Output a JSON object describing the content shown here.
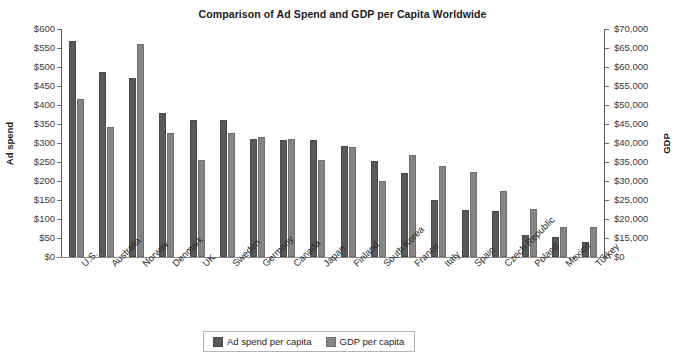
{
  "chart_data": {
    "type": "bar",
    "title": "Comparison of Ad Spend and GDP per Capita Worldwide",
    "xlabel": "",
    "ylabel": "Ad spend",
    "y2label": "GDP",
    "grid": false,
    "legend_position": "bottom",
    "ylim": [
      0,
      600
    ],
    "y2lim": [
      0,
      70000
    ],
    "y2_axis_break": true,
    "yticks": [
      "$0",
      "$50",
      "$100",
      "$150",
      "$200",
      "$250",
      "$300",
      "$350",
      "$400",
      "$450",
      "$500",
      "$550",
      "$600"
    ],
    "y2ticks": [
      "$0",
      "$15,000",
      "$20,000",
      "$25,000",
      "$30,000",
      "$35,000",
      "$40,000",
      "$45,000",
      "$50,000",
      "$55,000",
      "$60,000",
      "$65,000",
      "$70,000"
    ],
    "categories": [
      "U.S.",
      "Australia",
      "Norway",
      "Denmark",
      "UK",
      "Sweden",
      "Germany",
      "Canada",
      "Japan",
      "Finland",
      "South Korea",
      "France",
      "Italy",
      "Spain",
      "Czech Republic",
      "Poland",
      "Mexico",
      "Turkey"
    ],
    "series": [
      {
        "name": "Ad spend per capita",
        "axis": "left",
        "color": "#595959",
        "values": [
          568,
          487,
          472,
          378,
          361,
          361,
          310,
          308,
          308,
          292,
          253,
          222,
          151,
          125,
          121,
          57,
          52,
          39
        ]
      },
      {
        "name": "GDP per capita",
        "axis": "right",
        "color": "#858585",
        "values": [
          55700,
          50100,
          70000,
          49000,
          41000,
          49000,
          46700,
          46300,
          41000,
          44000,
          36500,
          42500,
          39500,
          37800,
          32500,
          27800,
          20300,
          20500
        ]
      }
    ],
    "gdp_plotted_left_scale": [
      417,
      343,
      560,
      327,
      256,
      327,
      315,
      310,
      256,
      290,
      199,
      269,
      240,
      223,
      174,
      126,
      78,
      80
    ]
  },
  "legend": {
    "items": [
      {
        "label": "Ad spend per capita",
        "swatch": "ad"
      },
      {
        "label": "GDP per capita",
        "swatch": "gdp"
      }
    ]
  }
}
